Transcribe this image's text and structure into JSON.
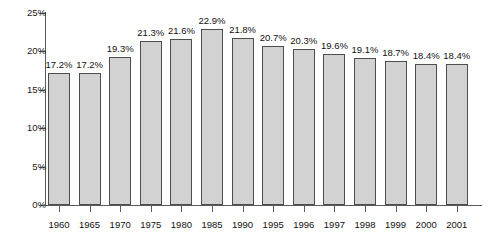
{
  "chart_data": {
    "type": "bar",
    "title": "",
    "subtitle": "",
    "xlabel": "",
    "ylabel": "",
    "ylim": [
      0,
      25
    ],
    "yticks": [
      "0%",
      "5%",
      "10%",
      "15%",
      "20%",
      "25%"
    ],
    "ytick_values": [
      0,
      5,
      10,
      15,
      20,
      25
    ],
    "grid": false,
    "legend": false,
    "legend_position": "none",
    "categories": [
      "1960",
      "1965",
      "1970",
      "1975",
      "1980",
      "1985",
      "1990",
      "1995",
      "1996",
      "1997",
      "1998",
      "1999",
      "2000",
      "2001"
    ],
    "values": [
      17.2,
      17.2,
      19.3,
      21.3,
      21.6,
      22.9,
      21.8,
      20.7,
      20.3,
      19.6,
      19.1,
      18.7,
      18.4,
      18.4
    ],
    "data_labels": [
      "17.2%",
      "17.2%",
      "19.3%",
      "21.3%",
      "21.6%",
      "22.9%",
      "21.8%",
      "20.7%",
      "20.3%",
      "19.6%",
      "19.1%",
      "18.7%",
      "18.4%",
      "18.4%"
    ],
    "bar_fill_color": "#d2d2d2",
    "bar_border_color": "#4d4d4d",
    "axis_color": "#5a5a5a",
    "background_color": "#ffffff",
    "text_color": "#111111"
  }
}
